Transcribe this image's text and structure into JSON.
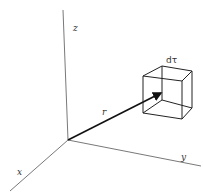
{
  "diagram": {
    "axes": {
      "z": {
        "label": "z"
      },
      "x": {
        "label": "x"
      },
      "y": {
        "label": "y"
      }
    },
    "vector": {
      "label": "r"
    },
    "volume_element": {
      "label": "dτ"
    },
    "colors": {
      "axis": "#555555",
      "vector": "#111111",
      "cube": "#222222",
      "text": "#333333",
      "background": "#ffffff"
    }
  }
}
